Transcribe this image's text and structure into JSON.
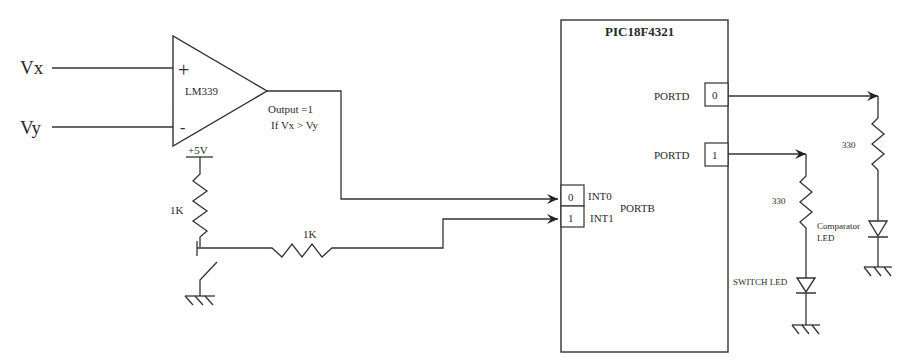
{
  "diagram": {
    "inputs": {
      "vx_label": "Vx",
      "vy_label": "Vy"
    },
    "comparator": {
      "part": "LM339",
      "plus_sign": "+",
      "minus_sign": "-",
      "output_line1": "Output =1",
      "output_line2": "If Vx > Vy"
    },
    "switch_circuit": {
      "supply_label": "+5V",
      "pullup_resistor": "1K",
      "series_resistor": "1K"
    },
    "microcontroller": {
      "name": "PIC18F4321",
      "portb_label": "PORTB",
      "portb_pins": [
        {
          "bit": "0",
          "name": "INT0"
        },
        {
          "bit": "1",
          "name": "INT1"
        }
      ],
      "portd_pins": [
        {
          "port": "PORTD",
          "bit": "0"
        },
        {
          "port": "PORTD",
          "bit": "1"
        }
      ]
    },
    "leds": {
      "comparator_resistor": "330",
      "comparator_led_line1": "Comparator",
      "comparator_led_line2": "LED",
      "switch_resistor": "330",
      "switch_led": "SWITCH LED"
    }
  }
}
